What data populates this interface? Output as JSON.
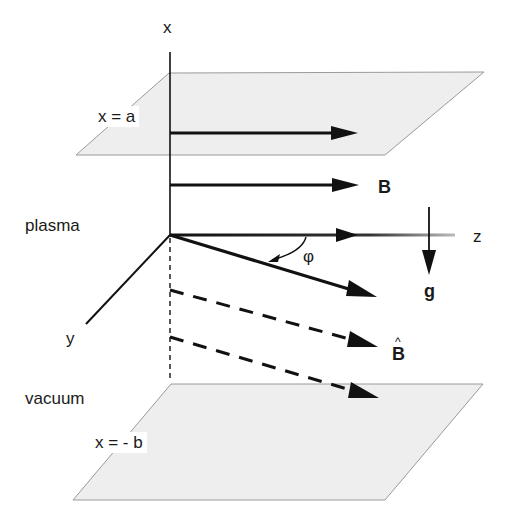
{
  "diagram": {
    "type": "3d-geometry-schematic",
    "colors": {
      "plane_fill": "#eeeeee",
      "plane_edge": "#9a9a9a",
      "line": "#111111",
      "background": "#ffffff"
    },
    "axes": {
      "x_label": "x",
      "y_label": "y",
      "z_label": "z"
    },
    "planes": [
      {
        "label": "x = a",
        "position": "upper"
      },
      {
        "label": "x = - b",
        "position": "lower"
      }
    ],
    "regions": {
      "upper": "plasma",
      "lower": "vacuum"
    },
    "vectors": {
      "field": "B",
      "field_hat": "B",
      "field_hat_accent": "^",
      "gravity": "g",
      "angle": "φ"
    }
  }
}
